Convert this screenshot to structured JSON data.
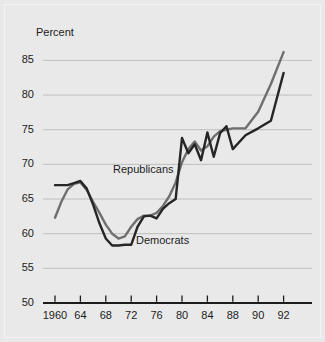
{
  "chart_data": {
    "type": "line",
    "title": "",
    "axis_unit_label": "Percent",
    "xlabel": "",
    "ylabel": "Percent",
    "ylim": [
      50,
      86.5
    ],
    "yticks": [
      50,
      55,
      60,
      65,
      70,
      75,
      80,
      85
    ],
    "ytick_labels": [
      "50",
      "55",
      "60",
      "65",
      "70",
      "75",
      "80",
      "85"
    ],
    "grid": "horizontal",
    "gridlines_at": [
      55,
      60,
      65,
      70,
      75,
      80,
      85
    ],
    "baseline_at": 50,
    "xticks": [
      1960,
      1964,
      1968,
      1972,
      1976,
      1980,
      1984,
      1988,
      1990,
      1992
    ],
    "xtick_labels": [
      "1960",
      "64",
      "68",
      "72",
      "76",
      "80",
      "84",
      "88",
      "90",
      "92"
    ],
    "xtick_spacing": "even",
    "legend_position": "inline-annotations",
    "colors": {
      "republicans": "#6f6f6f",
      "democrats": "#262626",
      "background": "#e9e9e9",
      "gridline": "#b9b9b9",
      "axis": "#1c1c1c",
      "text": "#1c1c1c"
    },
    "series": [
      {
        "name": "Republicans",
        "color": "#6f6f6f",
        "x": [
          1960,
          1961,
          1962,
          1963,
          1964,
          1965,
          1966,
          1967,
          1968,
          1969,
          1970,
          1971,
          1972,
          1973,
          1974,
          1975,
          1976,
          1977,
          1978,
          1979,
          1980,
          1981,
          1982,
          1983,
          1984,
          1985,
          1986,
          1987,
          1988,
          1989,
          1990,
          1991,
          1992
        ],
        "values": [
          62.3,
          64.6,
          66.4,
          67.2,
          67.4,
          66.3,
          64.6,
          63.0,
          61.3,
          60.0,
          59.3,
          59.6,
          61.0,
          62.1,
          62.6,
          62.6,
          63.0,
          64.0,
          65.4,
          67.4,
          70.3,
          72.2,
          73.3,
          72.0,
          72.6,
          74.0,
          74.8,
          75.0,
          75.2,
          75.2,
          77.6,
          81.6,
          86.2
        ]
      },
      {
        "name": "Democrats",
        "color": "#262626",
        "x": [
          1960,
          1961,
          1962,
          1963,
          1964,
          1965,
          1966,
          1967,
          1968,
          1969,
          1970,
          1971,
          1972,
          1973,
          1974,
          1975,
          1976,
          1977,
          1978,
          1979,
          1980,
          1981,
          1982,
          1983,
          1984,
          1985,
          1986,
          1987,
          1988,
          1989,
          1990,
          1991,
          1992
        ],
        "values": [
          67.0,
          67.0,
          67.0,
          67.3,
          67.6,
          66.5,
          64.2,
          61.5,
          59.3,
          58.3,
          58.3,
          58.4,
          58.4,
          61.0,
          62.5,
          62.6,
          62.2,
          63.6,
          64.4,
          65.0,
          73.8,
          71.6,
          72.9,
          70.6,
          74.6,
          71.1,
          74.5,
          75.5,
          72.2,
          74.2,
          75.2,
          76.3,
          83.2
        ]
      }
    ],
    "annotations": [
      {
        "name": "Republicans",
        "text": "Republicans"
      },
      {
        "name": "Democrats",
        "text": "Democrats"
      }
    ]
  }
}
